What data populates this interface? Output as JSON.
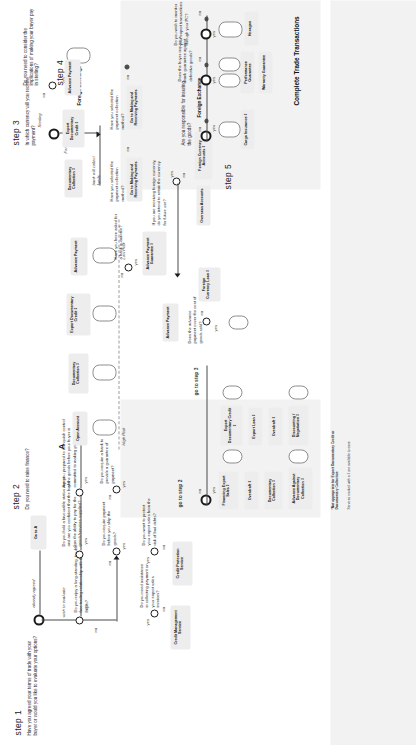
{
  "diagram": {
    "terminus": "Complete Trade Transactions",
    "marker_a": "A",
    "footnote_1": "*Not appropriate for Export Documentary Credit or Documentary Collection",
    "footnote_2": "Services marked with a ‡ are available to ease",
    "risk_low": "Low Risk",
    "risk_high": "High Risk"
  },
  "steps": [
    {
      "id": "step1",
      "label": "step 1",
      "title": "Have you agreed your terms of trade with your buyer or would you like to evaluate your options?"
    },
    {
      "id": "step2",
      "label": "step 2",
      "title": "Do you need to raise finance?"
    },
    {
      "id": "step3",
      "label": "step 3",
      "title": "In which currency will you receive payment?"
    },
    {
      "id": "step4",
      "label": "step 4",
      "title": "Do you need to consider the implications of making your buyer pay in sterling?"
    },
    {
      "id": "step5",
      "label": "step 5",
      "title": "Are you responsible for insuring the goods?"
    }
  ],
  "questions": {
    "q_relationship": "Do you enjoy a long-standing, trouble-free trading relationship with the buyer?",
    "q_status_report": "Do you hold a favourable status report and are you confident that the buyer has the ability to pay for the goods/services supplied?",
    "q_relinquish": "Are you prepared to relinquish control of the goods before your buyer is committed to making payment?",
    "q_pay_before_ship": "Do you require payment before you ship the goods?",
    "q_bank_guarantee": "Do you require a bank to provide a guarantee of payment?",
    "q_asked_bank_guarantee": "Have you been asked for a bank guarantee?",
    "q_assistance": "Do you need assistance in collecting payment on your export sales invoices?",
    "q_protect_bad_debts": "Do you want to protect your export sales from the risk of bad debts?",
    "q_advance_covers": "Does the advance payment cover the cost of goods sold?",
    "q_selected_method_a": "Have you selected the payment collection method?",
    "q_selected_method_b": "Have you selected the payment collection method?",
    "q_receiving_foreign": "If you are receiving foreign currency, do you intend to retain the currency for future use?",
    "q_buyer_defective": "Does the buyer require a bank guarantee against defective goods?",
    "q_monitor_pc": "Do you wish to monitor your export transactions through your PC?"
  },
  "edges": {
    "yes": "yes",
    "no": "no",
    "already_agreed": "already agreed",
    "wish_to_evaluate": "wish to evaluate",
    "sterling": "Sterling",
    "foreign_currency": "Foreign Currency",
    "foreign_exchange": "Foreign Exchange",
    "bank_collect": "bank will collect funds",
    "go_to_step2": "go to step 2",
    "go_to_step3": "go to step 3",
    "go_to_a": "Go to A"
  },
  "products": [
    {
      "id": "open-account",
      "label": "Open Account"
    },
    {
      "id": "documentary-collection",
      "label": "Documentary Collection ‡"
    },
    {
      "id": "export-documentary-credit",
      "label": "Export Documentary Credit ‡"
    },
    {
      "id": "advance-payment",
      "label": "Advance Payment"
    },
    {
      "id": "advance-payment-guarantee",
      "label": "Advance Payment Guarantee ‡"
    },
    {
      "id": "credit-management-service",
      "label": "Credit Management Service"
    },
    {
      "id": "credit-protection-service",
      "label": "Credit Protection Service"
    },
    {
      "id": "financing-export-sales",
      "label": "Financing Export Sales ‡"
    },
    {
      "id": "overdraft-1",
      "label": "Overdraft ‡"
    },
    {
      "id": "documentary-collection-2",
      "label": "Documentary Collection ‡"
    },
    {
      "id": "advance-against-collection",
      "label": "Advance Against Documentary Collection ‡"
    },
    {
      "id": "export-documentary-credit-2",
      "label": "Export Documentary Credit ‡"
    },
    {
      "id": "export-loan",
      "label": "Export Loan ‡"
    },
    {
      "id": "overdraft-2",
      "label": "Overdraft ‡"
    },
    {
      "id": "discounting-negotiation",
      "label": "Discounting / Negotiation ‡"
    },
    {
      "id": "advance-payment-2",
      "label": "Advance Payment"
    },
    {
      "id": "foreign-currency-loan",
      "label": "Foreign Currency Loan ‡"
    },
    {
      "id": "overseas-accounts",
      "label": "Overseas Accounts"
    },
    {
      "id": "foreign-currency-accounts",
      "label": "Foreign Currency Accounts ‡"
    },
    {
      "id": "go-making-receiving-a",
      "label": "Go to Making and Receiving Payments"
    },
    {
      "id": "go-making-receiving-b",
      "label": "Go to Making and Receiving Payments"
    },
    {
      "id": "cargo-insurance",
      "label": "Cargo Insurance ‡"
    },
    {
      "id": "performance-guarantee",
      "label": "Performance Guarantee"
    },
    {
      "id": "warranty-guarantee",
      "label": "Warranty Guarantee"
    },
    {
      "id": "hexagon",
      "label": "Hexagon"
    }
  ]
}
